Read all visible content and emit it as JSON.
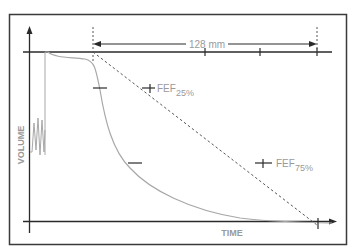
{
  "diagram": {
    "measure_label": "128 mm",
    "fef25_label": "FEF",
    "fef25_sub": "25%",
    "fef75_label": "FEF",
    "fef75_sub": "75%",
    "y_axis_label": "VOLUME",
    "x_axis_label": "TIME"
  },
  "colors": {
    "axis": "#2a2a2a",
    "curve": "#a8a8a8",
    "label": "#9a9a9a",
    "dashed": "#555555",
    "border": "#3a3a3a"
  }
}
